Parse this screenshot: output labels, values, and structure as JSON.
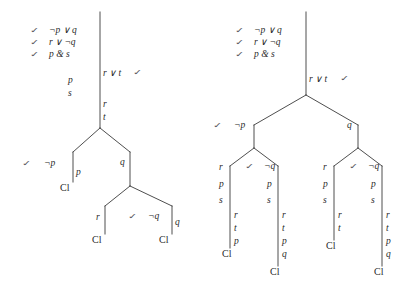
{
  "figure": {
    "ink_color": "#3a3a3a",
    "text_color": "#2b2b2b",
    "check_glyph": "✓"
  },
  "trees": [
    {
      "id": "left-tree",
      "premises": [
        {
          "check": "✓",
          "formula": "¬p ∨ q"
        },
        {
          "check": "✓",
          "formula": "r ∨ ¬q"
        },
        {
          "check": "✓",
          "formula": "p & s"
        }
      ],
      "trunk_labels": [
        {
          "text": "p"
        },
        {
          "text": "s"
        },
        {
          "text": "r ∨ t"
        },
        {
          "check": "✓"
        },
        {
          "text": "r"
        },
        {
          "text": "t"
        }
      ],
      "branch_labels": [
        {
          "check": "✓",
          "text": "¬p"
        },
        {
          "text": "p"
        },
        {
          "text": "q"
        },
        {
          "text": "r"
        },
        {
          "check": "✓",
          "text": "¬q"
        },
        {
          "text": "q"
        }
      ],
      "closures": [
        "Cl",
        "Cl",
        "Cl"
      ]
    },
    {
      "id": "right-tree",
      "premises": [
        {
          "check": "✓",
          "formula": "¬p ∨ q"
        },
        {
          "check": "✓",
          "formula": "r ∨ ¬q"
        },
        {
          "check": "✓",
          "formula": "p & s"
        }
      ],
      "trunk_labels": [
        {
          "text": "r ∨ t"
        },
        {
          "check": "✓"
        }
      ],
      "level1": [
        {
          "check": "✓",
          "text": "¬p"
        },
        {
          "text": "q"
        }
      ],
      "level2": [
        {
          "text": "r"
        },
        {
          "check": "✓",
          "text": "¬q"
        },
        {
          "text": "r"
        },
        {
          "check": "✓",
          "text": "¬q"
        }
      ],
      "columns": [
        {
          "labels": [
            "r",
            "p",
            "s",
            "r",
            "t",
            "p"
          ],
          "closure": "Cl"
        },
        {
          "labels": [
            "¬q",
            "p",
            "s",
            "r",
            "t",
            "p",
            "q"
          ],
          "closure": "Cl"
        },
        {
          "labels": [
            "r",
            "p",
            "s",
            "r",
            "t"
          ],
          "closure": "Cl"
        },
        {
          "labels": [
            "¬q",
            "p",
            "s",
            "r",
            "t",
            "p",
            "q"
          ],
          "closure": "Cl"
        }
      ]
    }
  ],
  "labels": {
    "neg_p_or_q": "¬p ∨ q",
    "r_or_neg_q": "r ∨ ¬q",
    "p_and_s": "p & s",
    "r_or_t": "r ∨ t",
    "p": "p",
    "s": "s",
    "r": "r",
    "t": "t",
    "q": "q",
    "neg_p": "¬p",
    "neg_q": "¬q",
    "cl": "Cl",
    "check": "✓"
  }
}
